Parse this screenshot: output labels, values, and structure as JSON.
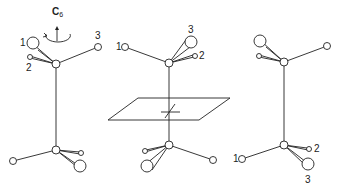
{
  "figure": {
    "panels": [
      {
        "id": "left",
        "annotation": "C6",
        "axis_label": "C",
        "axis_subscript": "6",
        "top_labels": [
          "1",
          "2",
          "3"
        ],
        "bottom_labels": []
      },
      {
        "id": "middle",
        "annotation": "mirror plane",
        "top_labels": [
          "1",
          "2",
          "3"
        ],
        "bottom_labels": []
      },
      {
        "id": "right",
        "annotation": "",
        "top_labels": [],
        "bottom_labels": [
          "1",
          "2",
          "3"
        ]
      }
    ]
  }
}
